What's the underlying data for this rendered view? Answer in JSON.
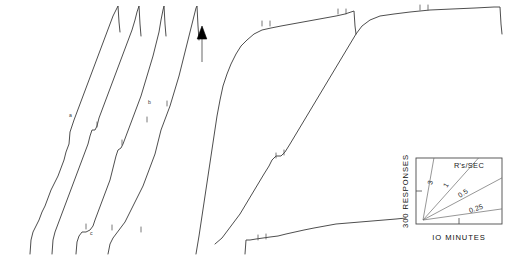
{
  "figure": {
    "ink_color": "#3a3a3a",
    "marker_color": "#000000",
    "background": "#ffffff"
  },
  "legend": {
    "name": "rate-key",
    "header_label": "R's/SEC",
    "y_axis_label": "300 RESPONSES",
    "x_axis_label": "IO MINUTES",
    "slopes": [
      {
        "label": "3",
        "value": 3
      },
      {
        "label": "1",
        "value": 1
      },
      {
        "label": "0.5",
        "value": 0.5
      },
      {
        "label": "0.25",
        "value": 0.25
      }
    ]
  },
  "annotations": {
    "arrow_label": "arrow-marker",
    "segment_a": "a",
    "segment_b": "b",
    "segment_c": "c"
  },
  "chart_data": {
    "type": "line",
    "xlabel": "IO MINUTES",
    "ylabel": "300 RESPONSES",
    "grid": false,
    "legend_position": "bottom-right",
    "axis_units": {
      "x_unit_label": "IO MINUTES",
      "y_unit_label": "300 RESPONSES"
    },
    "rate_key_slopes": [
      3,
      1,
      0.5,
      0.25
    ],
    "series": [
      {
        "name": "record-1",
        "note": "left cluster, first cumulative segment; steady intermediate rate with small pauses",
        "points": [
          [
            30,
            254
          ],
          [
            31,
            240
          ],
          [
            33,
            232
          ],
          [
            36,
            226
          ],
          [
            39,
            220
          ],
          [
            42,
            212
          ],
          [
            45,
            206
          ],
          [
            48,
            198
          ],
          [
            51,
            190
          ],
          [
            55,
            182
          ],
          [
            58,
            176
          ],
          [
            61,
            168
          ],
          [
            64,
            160
          ],
          [
            66,
            152
          ],
          [
            69,
            144
          ],
          [
            70,
            132
          ],
          [
            72,
            126
          ],
          [
            74,
            120
          ],
          [
            77,
            112
          ],
          [
            80,
            104
          ],
          [
            83,
            96
          ],
          [
            86,
            88
          ],
          [
            89,
            80
          ],
          [
            92,
            72
          ],
          [
            95,
            64
          ],
          [
            98,
            56
          ],
          [
            101,
            48
          ],
          [
            104,
            40
          ],
          [
            107,
            32
          ],
          [
            110,
            24
          ],
          [
            113,
            16
          ],
          [
            116,
            10
          ],
          [
            118,
            6
          ],
          [
            119,
            22
          ],
          [
            120,
            32
          ]
        ]
      },
      {
        "name": "record-2",
        "note": "left cluster, second segment; labelled 'a' mid-curve with a pause step",
        "points": [
          [
            52,
            254
          ],
          [
            53,
            240
          ],
          [
            55,
            232
          ],
          [
            58,
            224
          ],
          [
            61,
            216
          ],
          [
            64,
            208
          ],
          [
            67,
            200
          ],
          [
            70,
            192
          ],
          [
            73,
            184
          ],
          [
            76,
            176
          ],
          [
            79,
            168
          ],
          [
            82,
            160
          ],
          [
            85,
            152
          ],
          [
            88,
            144
          ],
          [
            90,
            136
          ],
          [
            92,
            130
          ],
          [
            95,
            130
          ],
          [
            97,
            126
          ],
          [
            99,
            118
          ],
          [
            102,
            110
          ],
          [
            105,
            102
          ],
          [
            108,
            94
          ],
          [
            111,
            86
          ],
          [
            114,
            78
          ],
          [
            117,
            70
          ],
          [
            120,
            62
          ],
          [
            123,
            54
          ],
          [
            126,
            46
          ],
          [
            129,
            38
          ],
          [
            132,
            30
          ],
          [
            135,
            20
          ],
          [
            137,
            12
          ],
          [
            139,
            6
          ],
          [
            140,
            24
          ],
          [
            141,
            36
          ]
        ]
      },
      {
        "name": "record-3",
        "note": "left cluster, third segment; labelled 'c' near the start, slightly lower rate",
        "points": [
          [
            76,
            254
          ],
          [
            77,
            242
          ],
          [
            79,
            236
          ],
          [
            82,
            232
          ],
          [
            86,
            232
          ],
          [
            90,
            230
          ],
          [
            93,
            226
          ],
          [
            95,
            220
          ],
          [
            98,
            212
          ],
          [
            101,
            204
          ],
          [
            104,
            196
          ],
          [
            107,
            188
          ],
          [
            110,
            180
          ],
          [
            112,
            172
          ],
          [
            114,
            164
          ],
          [
            116,
            156
          ],
          [
            118,
            150
          ],
          [
            121,
            148
          ],
          [
            123,
            144
          ],
          [
            126,
            136
          ],
          [
            129,
            128
          ],
          [
            132,
            120
          ],
          [
            135,
            112
          ],
          [
            138,
            104
          ],
          [
            141,
            96
          ],
          [
            144,
            86
          ],
          [
            147,
            76
          ],
          [
            150,
            66
          ],
          [
            153,
            56
          ],
          [
            156,
            44
          ],
          [
            159,
            32
          ],
          [
            161,
            20
          ],
          [
            163,
            10
          ],
          [
            164,
            6
          ],
          [
            165,
            24
          ],
          [
            166,
            36
          ]
        ]
      },
      {
        "name": "record-4",
        "note": "left cluster, fourth segment; labelled 'b', terminates at the arrow marker",
        "points": [
          [
            108,
            254
          ],
          [
            110,
            244
          ],
          [
            113,
            238
          ],
          [
            116,
            234
          ],
          [
            119,
            230
          ],
          [
            122,
            226
          ],
          [
            125,
            222
          ],
          [
            128,
            216
          ],
          [
            131,
            210
          ],
          [
            134,
            204
          ],
          [
            137,
            198
          ],
          [
            140,
            192
          ],
          [
            143,
            186
          ],
          [
            146,
            178
          ],
          [
            149,
            170
          ],
          [
            152,
            162
          ],
          [
            155,
            154
          ],
          [
            157,
            146
          ],
          [
            159,
            138
          ],
          [
            161,
            130
          ],
          [
            164,
            122
          ],
          [
            167,
            114
          ],
          [
            170,
            106
          ],
          [
            173,
            96
          ],
          [
            176,
            86
          ],
          [
            179,
            76
          ],
          [
            182,
            64
          ],
          [
            185,
            52
          ],
          [
            188,
            40
          ],
          [
            191,
            28
          ],
          [
            194,
            16
          ],
          [
            196,
            8
          ],
          [
            197,
            6
          ],
          [
            198,
            26
          ],
          [
            199,
            40
          ]
        ]
      },
      {
        "name": "record-5",
        "note": "main right record; negatively accelerated — fast initial burst then long plateau, ends with pen reset",
        "points": [
          [
            196,
            254
          ],
          [
            199,
            236
          ],
          [
            202,
            216
          ],
          [
            205,
            196
          ],
          [
            208,
            176
          ],
          [
            211,
            156
          ],
          [
            214,
            136
          ],
          [
            217,
            116
          ],
          [
            220,
            100
          ],
          [
            223,
            86
          ],
          [
            227,
            74
          ],
          [
            231,
            64
          ],
          [
            236,
            54
          ],
          [
            241,
            46
          ],
          [
            247,
            40
          ],
          [
            254,
            34
          ],
          [
            262,
            30
          ],
          [
            271,
            28
          ],
          [
            281,
            26
          ],
          [
            292,
            24
          ],
          [
            303,
            22
          ],
          [
            314,
            20
          ],
          [
            325,
            18
          ],
          [
            336,
            16
          ],
          [
            345,
            14
          ],
          [
            351,
            12
          ],
          [
            354,
            11
          ],
          [
            355,
            26
          ],
          [
            356,
            34
          ]
        ]
      },
      {
        "name": "record-6",
        "note": "second right record; steady high rate rising from baseline with a pause step, plateaus at top right",
        "points": [
          [
            215,
            244
          ],
          [
            222,
            238
          ],
          [
            228,
            230
          ],
          [
            234,
            222
          ],
          [
            240,
            214
          ],
          [
            246,
            204
          ],
          [
            252,
            194
          ],
          [
            258,
            184
          ],
          [
            264,
            174
          ],
          [
            269,
            166
          ],
          [
            272,
            160
          ],
          [
            276,
            156
          ],
          [
            281,
            156
          ],
          [
            285,
            152
          ],
          [
            290,
            144
          ],
          [
            296,
            134
          ],
          [
            302,
            124
          ],
          [
            308,
            114
          ],
          [
            314,
            104
          ],
          [
            320,
            94
          ],
          [
            326,
            84
          ],
          [
            332,
            74
          ],
          [
            338,
            64
          ],
          [
            344,
            54
          ],
          [
            350,
            44
          ],
          [
            356,
            34
          ],
          [
            362,
            26
          ],
          [
            370,
            20
          ],
          [
            380,
            16
          ],
          [
            394,
            14
          ],
          [
            410,
            12
          ],
          [
            430,
            10
          ],
          [
            452,
            9
          ],
          [
            475,
            8
          ],
          [
            494,
            7
          ],
          [
            500,
            7
          ],
          [
            501,
            24
          ],
          [
            502,
            34
          ]
        ]
      },
      {
        "name": "record-7",
        "note": "bottom right record; very low near-flat response rate baseline",
        "points": [
          [
            245,
            254
          ],
          [
            246,
            240
          ],
          [
            250,
            240
          ],
          [
            256,
            239
          ],
          [
            263,
            238
          ],
          [
            270,
            237
          ],
          [
            278,
            236
          ],
          [
            286,
            234
          ],
          [
            295,
            232
          ],
          [
            304,
            230
          ],
          [
            314,
            228
          ],
          [
            325,
            226
          ],
          [
            336,
            224
          ],
          [
            348,
            223
          ],
          [
            360,
            222
          ],
          [
            372,
            221
          ],
          [
            384,
            220
          ],
          [
            396,
            219
          ],
          [
            406,
            218
          ]
        ]
      }
    ],
    "event_pips": [
      {
        "x": 97,
        "y": 127
      },
      {
        "x": 122,
        "y": 145
      },
      {
        "x": 147,
        "y": 122
      },
      {
        "x": 167,
        "y": 106
      },
      {
        "x": 86,
        "y": 229
      },
      {
        "x": 112,
        "y": 230
      },
      {
        "x": 141,
        "y": 232
      },
      {
        "x": 262,
        "y": 26
      },
      {
        "x": 270,
        "y": 26
      },
      {
        "x": 338,
        "y": 14
      },
      {
        "x": 346,
        "y": 14
      },
      {
        "x": 420,
        "y": 10
      },
      {
        "x": 428,
        "y": 10
      },
      {
        "x": 276,
        "y": 158
      },
      {
        "x": 284,
        "y": 155
      },
      {
        "x": 258,
        "y": 240
      },
      {
        "x": 266,
        "y": 239
      }
    ]
  }
}
